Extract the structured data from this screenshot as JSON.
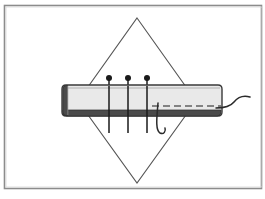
{
  "figure": {
    "title": "Sewing technique illustration: pinned fabric strip with needle and thread",
    "frame": {
      "border_color": "#8c8c8c",
      "background_color": "#ffffff",
      "x": 4,
      "y": 5,
      "width": 261,
      "height": 184
    },
    "colors": {
      "outline": "#3a3a3a",
      "fabric_fill": "#e9e9e9",
      "fabric_edge_dark": "#4a4a4a",
      "diamond_stroke": "#555555",
      "pin_color": "#1a1a1a",
      "thread_color": "#2b2b2b",
      "dashed_seam_color": "#606060"
    },
    "elements": [
      {
        "name": "diamond-outline",
        "label": "Diamond background outline",
        "points": "137,18 196,101 137,183 78,101",
        "stroke_width": 1.1,
        "fill": "none"
      },
      {
        "name": "fabric-band",
        "label": "Fabric band",
        "x": 62,
        "y": 85,
        "width": 160,
        "height": 31,
        "corner_radius": 4
      },
      {
        "name": "fabric-left-end-cap",
        "label": "Folded left end of band",
        "x": 62,
        "y": 86,
        "width": 5,
        "height": 29
      },
      {
        "name": "fabric-bottom-edge",
        "label": "Dark lower folded edge of band",
        "x": 63,
        "y": 110,
        "width": 158,
        "height": 6
      },
      {
        "name": "dashed-seam-line",
        "label": "Dashed stitching guide line",
        "x1": 152,
        "y1": 106,
        "x2": 221,
        "y2": 106,
        "dash_pattern": "7 4"
      }
    ],
    "pins": [
      {
        "label": "Pin 1",
        "head_x": 109,
        "head_y": 78,
        "head_radius": 3,
        "shaft_bottom_y": 133
      },
      {
        "label": "Pin 2",
        "head_x": 128,
        "head_y": 78,
        "head_radius": 3,
        "shaft_bottom_y": 133
      },
      {
        "label": "Pin 3",
        "head_x": 147,
        "head_y": 78,
        "head_radius": 3,
        "shaft_bottom_y": 133
      }
    ],
    "needle_thread": {
      "label": "Needle and thread",
      "hook_path": "M158,103 C157,116 155,130 160,133 C164,135 166,131 165,128",
      "tail_path": "M216,108 C224,108 230,107 234,102 C238,97 243,95 250,97"
    }
  }
}
